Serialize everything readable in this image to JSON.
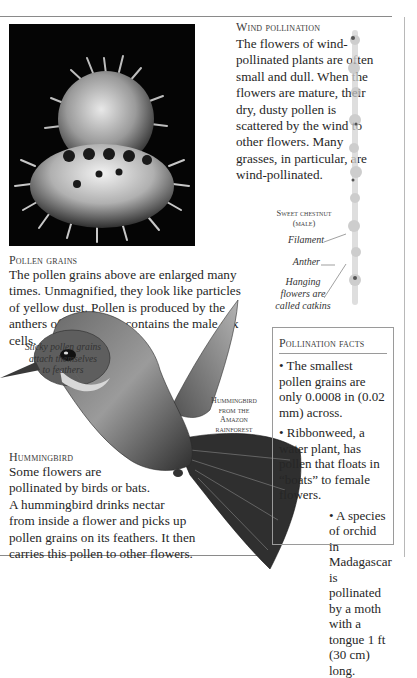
{
  "pollen_grains": {
    "photo_alt": "Magnified pollen grains (micrograph)",
    "heading": "Pollen grains",
    "text": "The pollen grains above are enlarged many times. Unmagnified, they look like particles of yellow dust. Pollen is produced by the anthers of a flower. It contains the male sex cells."
  },
  "wind_pollination": {
    "heading": "Wind pollination",
    "text": "The flowers of wind-pollinated plants are often small and dull. When the flowers are mature, their dry, dusty pollen is scattered by the wind to other flowers. Many grasses, in particular, are wind-pollinated."
  },
  "sweet_chestnut": {
    "title_line1": "Sweet chestnut",
    "title_line2": "(male)",
    "labels": {
      "filament": "Filament",
      "anther": "Anther",
      "catkins_line1": "Hanging",
      "catkins_line2": "flowers are",
      "catkins_line3": "called catkins"
    }
  },
  "hummingbird_annotation": {
    "sticky_line1": "Sticky pollen grains",
    "sticky_line2": "attach themselves",
    "sticky_line3": "to feathers",
    "species_line1": "Hummingbird",
    "species_line2": "from the",
    "species_line3": "Amazon",
    "species_line4": "rainforest"
  },
  "hummingbird": {
    "heading": "Hummingbird",
    "lines": [
      "Some flowers are",
      "pollinated by birds or bats.",
      "A hummingbird drinks nectar",
      "from inside a flower and picks up",
      "pollen grains on its feathers. It then",
      "carries this pollen to other flowers."
    ]
  },
  "pollination_facts": {
    "heading": "Pollination facts",
    "facts": [
      "• The smallest pollen grains are only 0.0008 in (0.02 mm) across.",
      "• Ribbonweed, a water plant, has pollen that floats in “boats” to female flowers.",
      "• A species of orchid in Madagascar is pollinated by a moth with a tongue 1 ft (30 cm) long."
    ]
  }
}
